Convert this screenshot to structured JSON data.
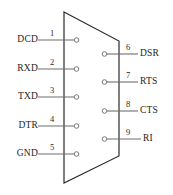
{
  "diagram": {
    "type": "db9-serial-connector-pinout",
    "body_shape": "trapezoid",
    "colors": {
      "background": "#ffffff",
      "outline": "#2a2a2a",
      "lead_line": "#6e6e6e",
      "pin_circle_stroke": "#7a7a7a",
      "text": "#1d1d1d"
    },
    "left_pins": [
      {
        "number": "1",
        "label": "DCD",
        "label_x": 10,
        "label_y": 35,
        "line_y": 40,
        "num_x": 48,
        "num_y": 29
      },
      {
        "number": "2",
        "label": "RXD",
        "label_y": 64,
        "line_y": 69,
        "num_y": 58
      },
      {
        "number": "3",
        "label": "TXD",
        "label_y": 92,
        "line_y": 97,
        "num_y": 86
      },
      {
        "number": "4",
        "label": "DTR",
        "label_y": 121,
        "line_y": 126,
        "num_y": 115
      },
      {
        "number": "5",
        "label": "GND",
        "label_y": 149,
        "line_y": 154,
        "num_y": 143
      }
    ],
    "right_pins": [
      {
        "number": "6",
        "label": "DSR",
        "label_y": 49,
        "line_y": 54,
        "num_y": 43
      },
      {
        "number": "7",
        "label": "RTS",
        "label_y": 77,
        "line_y": 82,
        "num_y": 71
      },
      {
        "number": "8",
        "label": "CTS",
        "label_y": 106,
        "line_y": 111,
        "num_y": 100
      },
      {
        "number": "9",
        "label": "RI",
        "label_y": 134,
        "line_y": 139,
        "num_y": 128
      }
    ]
  }
}
